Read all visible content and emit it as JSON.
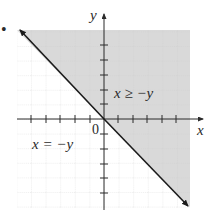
{
  "figure": {
    "bullet": "•",
    "axes": {
      "x_label": "x",
      "y_label": "y",
      "origin_label": "0",
      "x_range": [
        -6,
        6
      ],
      "y_range": [
        -6,
        6
      ],
      "tick_step": 1,
      "grid": true
    },
    "boundary_line": {
      "equation_label": "x = −y",
      "style": "solid",
      "arrows": "both"
    },
    "region": {
      "inequality_label": "x ≥ −y",
      "shaded_side": "upper-right",
      "shade_color": "#d9d9d9"
    },
    "colors": {
      "axis": "#2b2b2b",
      "line": "#1a1a1a",
      "grid": "#c8c8c8",
      "shade": "#d9d9d9"
    }
  }
}
